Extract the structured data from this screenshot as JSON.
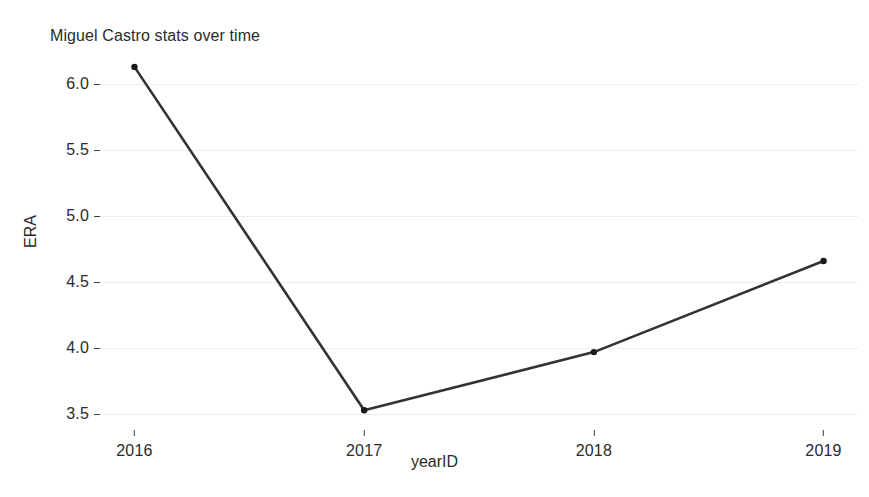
{
  "chart_data": {
    "type": "line",
    "title": "Miguel Castro stats over time",
    "xlabel": "yearID",
    "ylabel": "ERA",
    "x": [
      2016,
      2017,
      2018,
      2019
    ],
    "categories": [
      "2016",
      "2017",
      "2018",
      "2019"
    ],
    "values": [
      6.13,
      3.53,
      3.97,
      4.66
    ],
    "series": [
      {
        "name": "ERA",
        "values": [
          6.13,
          3.53,
          3.97,
          4.66
        ]
      }
    ],
    "xtick_labels": [
      "2016",
      "2017",
      "2018",
      "2019"
    ],
    "ytick_labels": [
      "6.0",
      "5.5",
      "5.0",
      "4.5",
      "4.0",
      "3.5"
    ],
    "ytick_values": [
      6.0,
      5.5,
      5.0,
      4.5,
      4.0,
      3.5
    ],
    "ylim": [
      3.38,
      6.22
    ],
    "xlim": [
      2015.85,
      2019.15
    ],
    "grid": "horizontal",
    "legend": "none",
    "marker": "point",
    "line_color": "#333333",
    "marker_color": "#1a1a1a",
    "grid_color": "#ededed",
    "background_color": "#ffffff",
    "text_color": "#2b2b2b"
  }
}
